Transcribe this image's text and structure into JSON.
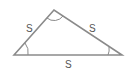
{
  "diagram": {
    "type": "triangle",
    "side_labels": {
      "left": "S",
      "right": "S",
      "bottom": "S"
    },
    "angle_marks": [
      "left-vertex",
      "apex",
      "right-vertex"
    ],
    "stroke_color": "#8a8a8a",
    "label_color": "#555555"
  }
}
